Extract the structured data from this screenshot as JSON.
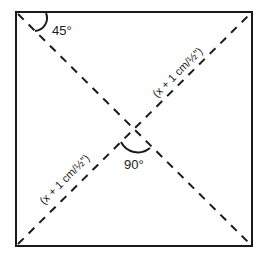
{
  "diagram": {
    "type": "square-with-diagonals",
    "labels": {
      "corner_angle": "45°",
      "center_angle": "90°",
      "diagonal_upper": "(x + 1 cm/½\")",
      "diagonal_lower": "(x + 1 cm/½\")"
    },
    "colors": {
      "stroke": "#1a1a1a",
      "background": "#ffffff"
    }
  }
}
